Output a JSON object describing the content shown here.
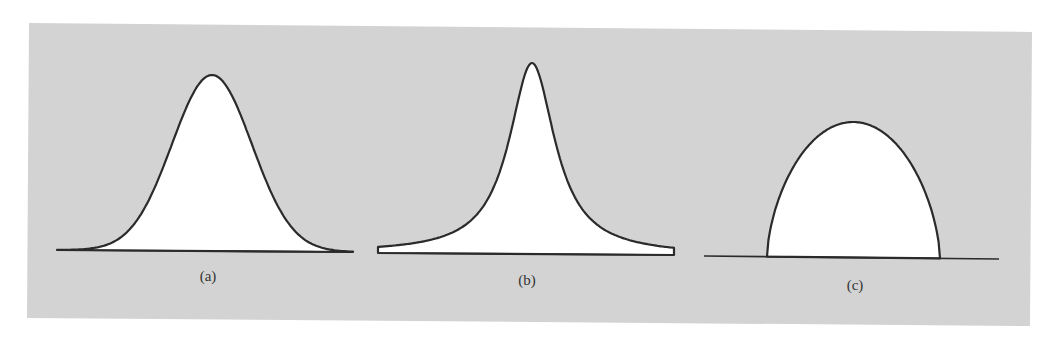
{
  "figure": {
    "background_color": "#ffffff",
    "panel_color": "#d3d3d3",
    "stroke_color": "#2b2b2b",
    "fill_color": "#ffffff",
    "panel_corners": [
      [
        29,
        23
      ],
      [
        1032,
        32
      ],
      [
        1030,
        326
      ],
      [
        27,
        318
      ]
    ]
  },
  "panels": [
    {
      "id": "a",
      "label": "(a)",
      "shape": "gaussian",
      "baseline": {
        "x1": 57,
        "y1": 250,
        "x2": 353,
        "y2": 252
      },
      "peak": {
        "x": 212,
        "y": 75
      },
      "width_param": 40,
      "label_pos": {
        "x": 208,
        "y": 281
      }
    },
    {
      "id": "b",
      "label": "(b)",
      "shape": "cauchy",
      "baseline": {
        "x1": 378,
        "y1": 253,
        "x2": 674,
        "y2": 255
      },
      "peak": {
        "x": 532,
        "y": 63
      },
      "width_param": 28,
      "label_pos": {
        "x": 527,
        "y": 285
      }
    },
    {
      "id": "c",
      "label": "(c)",
      "shape": "semi-ellipse",
      "baseline": {
        "x1": 704,
        "y1": 256,
        "x2": 999,
        "y2": 259
      },
      "peak": {
        "x": 855,
        "y": 122
      },
      "support": {
        "left": 767,
        "right": 940
      },
      "label_pos": {
        "x": 855,
        "y": 290
      }
    }
  ]
}
